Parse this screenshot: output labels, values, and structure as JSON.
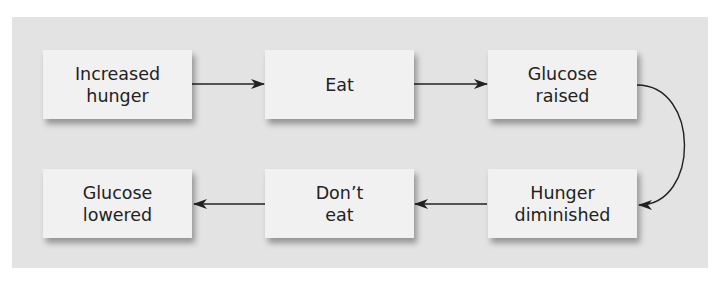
{
  "diagram": {
    "type": "flowchart",
    "background_color": "#e3e3e3",
    "box_color": "#f1f1f1",
    "nodes": [
      {
        "id": "increased_hunger",
        "line1": "Increased",
        "line2": "hunger"
      },
      {
        "id": "eat",
        "line1": "Eat",
        "line2": ""
      },
      {
        "id": "glucose_raised",
        "line1": "Glucose",
        "line2": "raised"
      },
      {
        "id": "hunger_diminished",
        "line1": "Hunger",
        "line2": "diminished"
      },
      {
        "id": "dont_eat",
        "line1": "Don’t",
        "line2": "eat"
      },
      {
        "id": "glucose_lowered",
        "line1": "Glucose",
        "line2": "lowered"
      }
    ],
    "edges": [
      {
        "from": "increased_hunger",
        "to": "eat"
      },
      {
        "from": "eat",
        "to": "glucose_raised"
      },
      {
        "from": "glucose_raised",
        "to": "hunger_diminished"
      },
      {
        "from": "hunger_diminished",
        "to": "dont_eat"
      },
      {
        "from": "dont_eat",
        "to": "glucose_lowered"
      }
    ]
  }
}
